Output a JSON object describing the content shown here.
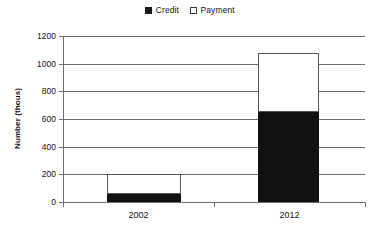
{
  "chart_data": {
    "type": "bar",
    "subtype": "stacked-vertical",
    "title": "",
    "xlabel": "",
    "ylabel": "Number (thous)",
    "categories": [
      "2002",
      "2012"
    ],
    "series": [
      {
        "name": "Credit",
        "values": [
          60,
          650
        ],
        "color": "#111111",
        "swatch": "filled"
      },
      {
        "name": "Payment",
        "values": [
          140,
          425
        ],
        "color": "#ffffff",
        "swatch": "hollow"
      }
    ],
    "totals": [
      200,
      1075
    ],
    "ylim": [
      0,
      1200
    ],
    "ytick_step": 200,
    "yticks": [
      1200,
      1000,
      800,
      600,
      400,
      200,
      0
    ],
    "ytick_labels": [
      "1200",
      "1000",
      "800",
      "600",
      "400",
      "200",
      "0"
    ],
    "grid": true,
    "grid_axis": "y",
    "legend": true,
    "legend_position": "top-center",
    "legend_entries": [
      "Credit",
      "Payment"
    ],
    "colors": {
      "credit": "#111111",
      "payment": "#ffffff",
      "axis": "#6e6e6e",
      "grid": "#6e6e6e",
      "text": "#111111",
      "background": "#ffffff"
    }
  }
}
